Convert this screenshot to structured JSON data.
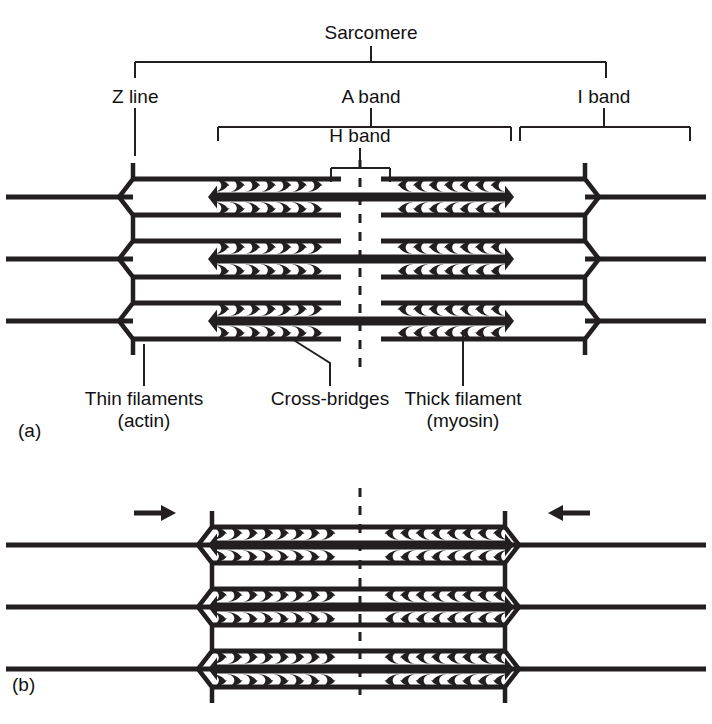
{
  "figure": {
    "title_semantic": "sarcomere-structure-diagram",
    "stroke_color": "#231f20",
    "background_color": "#ffffff"
  },
  "brackets": {
    "sarcomere": {
      "label": "Sarcomere",
      "left_x": 135,
      "right_x": 606,
      "bar_y": 62,
      "tick_down": 16,
      "stem_top": 46,
      "label_x": 371,
      "label_y": 22
    },
    "z_line": {
      "label": "Z line",
      "label_x": 140,
      "label_y": 86,
      "leader_x": 135,
      "leader_top": 108,
      "leader_bottom": 156
    },
    "a_band": {
      "label": "A band",
      "label_x": 371,
      "label_y": 86,
      "left_x": 218,
      "right_x": 511,
      "bar_y": 127,
      "stem_top": 108,
      "tick_down": 14
    },
    "i_band": {
      "label": "I band",
      "label_x": 604,
      "label_y": 86,
      "left_x": 520,
      "right_x": 690,
      "bar_y": 127,
      "stem_top": 108,
      "tick_down": 14
    },
    "h_band": {
      "label": "H band",
      "label_x": 360,
      "label_y": 125,
      "left_x": 331,
      "right_x": 390,
      "bar_y": 168,
      "stem_top": 148,
      "tick_down": 14
    }
  },
  "panel_a": {
    "caption": "(a)",
    "caption_x": 18,
    "caption_y": 420,
    "filament_rows_y": [
      197,
      259,
      321
    ],
    "z_left_x": 133,
    "z_right_x": 585,
    "thin_left_start": 6,
    "thin_right_end": 706,
    "thick_left_x": 217,
    "thick_right_x": 505,
    "dashed_line_x": 360,
    "dashed_top": 160,
    "dashed_bottom": 368,
    "labels": [
      {
        "name": "thin-filaments-label",
        "line1": "Thin filaments",
        "line2": "(actin)",
        "x": 144,
        "y": 392,
        "leader_x": 144,
        "leader_top": 344,
        "leader_bottom": 386
      },
      {
        "name": "cross-bridges-label",
        "line1": "Cross-bridges",
        "line2": "",
        "x": 330,
        "y": 392,
        "leader_x": 330,
        "leader_top": 386,
        "leader_bottom": 363,
        "diagonal_to_x": 292,
        "diagonal_to_y": 339
      },
      {
        "name": "thick-filament-label",
        "line1": "Thick filament",
        "line2": "(myosin)",
        "x": 463,
        "y": 392,
        "leader_x": 463,
        "leader_top": 330,
        "leader_bottom": 386
      }
    ]
  },
  "panel_b": {
    "caption": "(b)",
    "caption_x": 12,
    "caption_y": 674,
    "filament_rows_y": [
      545,
      607,
      669
    ],
    "z_left_x": 212,
    "z_right_x": 505,
    "thin_left_start": 6,
    "thin_right_end": 706,
    "thick_left_x": 217,
    "thick_right_x": 505,
    "dashed_line_x": 360,
    "dashed_top": 488,
    "dashed_bottom": 700,
    "arrows": [
      {
        "name": "contraction-arrow-left",
        "direction": "right",
        "tail_x": 134,
        "head_x": 176,
        "y": 513
      },
      {
        "name": "contraction-arrow-right",
        "direction": "left",
        "tail_x": 590,
        "head_x": 548,
        "y": 513
      }
    ]
  }
}
